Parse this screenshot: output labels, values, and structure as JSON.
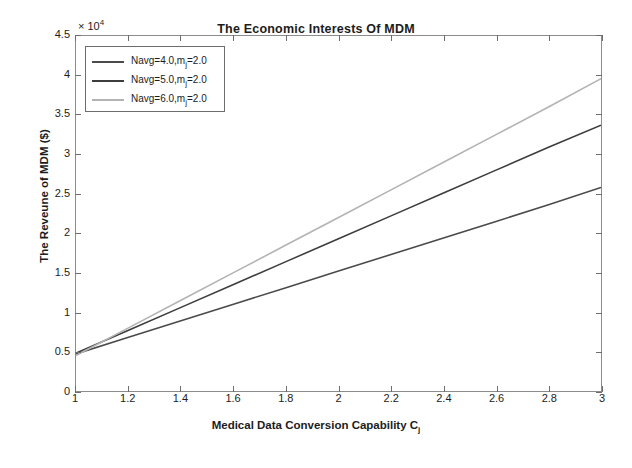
{
  "chart_data": {
    "type": "line",
    "title": "The Economic Interests Of MDM",
    "xlabel": "Medical Data Conversion Capability C",
    "xlabel_sub": "j",
    "ylabel": "The Reveune of MDM ($)",
    "y_exponent_prefix": "× 10",
    "y_exponent_power": "4",
    "y_multiplier": 10000,
    "xlim": [
      1,
      3
    ],
    "ylim": [
      0,
      45000
    ],
    "xticks": [
      1,
      1.2,
      1.4,
      1.6,
      1.8,
      2,
      2.2,
      2.4,
      2.6,
      2.8,
      3
    ],
    "xticklabels": [
      "1",
      "1.2",
      "1.4",
      "1.6",
      "1.8",
      "2",
      "2.2",
      "2.4",
      "2.6",
      "2.8",
      "3"
    ],
    "yticks": [
      0,
      5000,
      10000,
      15000,
      20000,
      25000,
      30000,
      35000,
      40000,
      45000
    ],
    "yticklabels": [
      "0",
      "0.5",
      "1",
      "1.5",
      "2",
      "2.5",
      "3",
      "3.5",
      "4",
      "4.5"
    ],
    "grid": false,
    "legend_position": "upper left",
    "series": [
      {
        "name": "Navg=4.0,m_j=2.0",
        "label_main": "Navg=4.0,m",
        "label_sub": "j",
        "label_tail": "=2.0",
        "color": "#4a4a4a",
        "width": 1.6,
        "x": [
          1,
          1.2,
          1.4,
          1.6,
          1.8,
          2,
          2.2,
          2.4,
          2.6,
          2.8,
          3
        ],
        "values": [
          4700,
          6800,
          8900,
          11000,
          13100,
          15200,
          17300,
          19400,
          21500,
          23600,
          25800
        ]
      },
      {
        "name": "Navg=5.0,m_j=2.0",
        "label_main": "Navg=5.0,m",
        "label_sub": "j",
        "label_tail": "=2.0",
        "color": "#3d3d3d",
        "width": 1.6,
        "x": [
          1,
          1.2,
          1.4,
          1.6,
          1.8,
          2,
          2.2,
          2.4,
          2.6,
          2.8,
          3
        ],
        "values": [
          4800,
          7700,
          10600,
          13500,
          16400,
          19300,
          22200,
          25100,
          28000,
          30900,
          33700
        ]
      },
      {
        "name": "Navg=6.0,m_j=2.0",
        "label_main": "Navg=6.0,m",
        "label_sub": "j",
        "label_tail": "=2.0",
        "color": "#b3b3b3",
        "width": 1.6,
        "x": [
          1,
          1.2,
          1.4,
          1.6,
          1.8,
          2,
          2.2,
          2.4,
          2.6,
          2.8,
          3
        ],
        "values": [
          4500,
          8000,
          11500,
          15000,
          18500,
          22000,
          25500,
          29000,
          32500,
          36000,
          39600
        ]
      }
    ]
  }
}
